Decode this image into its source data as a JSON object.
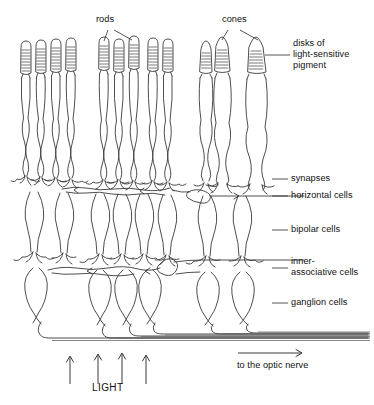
{
  "figure": {
    "background_color": "#ffffff",
    "line_color": "#3a3a3a",
    "width": 374,
    "height": 405
  },
  "labels": {
    "rods": "rods",
    "cones": "cones",
    "disks_line1": "disks of",
    "disks_line2": "light-sensitive",
    "disks_line3": "pigment",
    "synapses": "synapses",
    "horizontal_cells": "horizontal cells",
    "bipolar_cells": "bipolar cells",
    "inner_line1": "inner-",
    "inner_line2": "associative cells",
    "ganglion_cells": "ganglion cells",
    "light": "LIGHT",
    "optic_nerve": "to the optic nerve"
  },
  "structure": {
    "photoreceptor_groups": [
      {
        "name": "left-rod-group",
        "type": "rod",
        "count": 4,
        "x_positions": [
          26,
          41,
          56,
          71
        ]
      },
      {
        "name": "middle-rod-group",
        "type": "rod",
        "count": 5,
        "x_positions": [
          104,
          119,
          134,
          153,
          168
        ]
      },
      {
        "name": "cone-group",
        "type": "cone",
        "count": 3,
        "x_positions": [
          203,
          222,
          256
        ]
      }
    ],
    "bipolar_cells": {
      "count": 8,
      "x_positions": [
        33,
        63,
        99,
        121,
        143,
        166,
        206,
        240
      ]
    },
    "ganglion_cells": {
      "count": 6,
      "x_positions": [
        36,
        100,
        126,
        150,
        208,
        243
      ]
    },
    "horizontal_cell_layer_y": 186,
    "inner_associative_layer_y": 268,
    "optic_nerve_fiber_layer_y": 340
  },
  "annotations": {
    "light_arrow_count": 4,
    "light_arrow_x": [
      70,
      98,
      122,
      146
    ],
    "light_arrow_y_start": 383,
    "light_arrow_y_end": 355,
    "optic_nerve_arrow": {
      "x_start": 238,
      "x_end": 300,
      "y": 353,
      "direction": "right"
    }
  }
}
